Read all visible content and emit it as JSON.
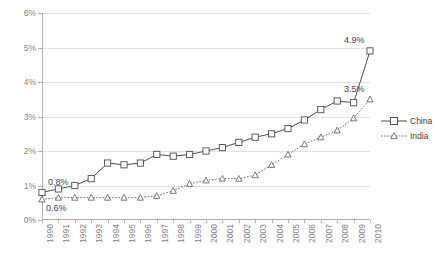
{
  "chart_data": {
    "type": "line",
    "title": "",
    "xlabel": "",
    "ylabel": "",
    "ylim": [
      0,
      6
    ],
    "ytick_labels": [
      "0%",
      "1%",
      "2%",
      "3%",
      "4%",
      "5%",
      "6%"
    ],
    "ytick_values": [
      0,
      1,
      2,
      3,
      4,
      5,
      6
    ],
    "grid": true,
    "legend_position": "right",
    "value_suffix": "%",
    "categories": [
      "1990",
      "1991",
      "1992",
      "1993",
      "1994",
      "1995",
      "1996",
      "1997",
      "1998",
      "1999",
      "2000",
      "2001",
      "2002",
      "2003",
      "2004",
      "2005",
      "2006",
      "2007",
      "2008",
      "2009",
      "2010"
    ],
    "series": [
      {
        "name": "China",
        "marker": "open-square",
        "line_style": "solid",
        "color": "#4d4d4d",
        "values": [
          0.8,
          0.9,
          1.0,
          1.2,
          1.65,
          1.6,
          1.65,
          1.9,
          1.85,
          1.9,
          2.0,
          2.1,
          2.25,
          2.4,
          2.5,
          2.65,
          2.9,
          3.2,
          3.45,
          3.4,
          4.9
        ]
      },
      {
        "name": "India",
        "marker": "open-triangle",
        "line_style": "dotted",
        "color": "#6b6b6b",
        "values": [
          0.6,
          0.65,
          0.65,
          0.65,
          0.65,
          0.65,
          0.65,
          0.7,
          0.85,
          1.05,
          1.15,
          1.2,
          1.2,
          1.3,
          1.6,
          1.9,
          2.2,
          2.4,
          2.6,
          2.95,
          3.5
        ]
      }
    ],
    "annotations": [
      {
        "text": "0.8%",
        "series": "China",
        "category": "1990",
        "value": 0.8
      },
      {
        "text": "0.6%",
        "series": "India",
        "category": "1990",
        "value": 0.6
      },
      {
        "text": "4.9%",
        "series": "China",
        "category": "2010",
        "value": 4.9
      },
      {
        "text": "3.5%",
        "series": "India",
        "category": "2010",
        "value": 3.5
      }
    ]
  },
  "legend": {
    "items": [
      {
        "label": "China"
      },
      {
        "label": "India"
      }
    ]
  }
}
